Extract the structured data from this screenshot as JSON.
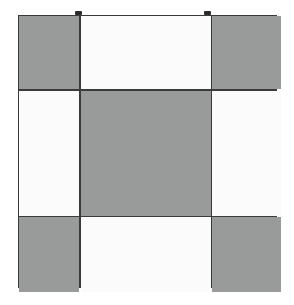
{
  "figure": {
    "canvas": {
      "width": 294,
      "height": 305,
      "background": "#ffffff"
    },
    "palette": {
      "dark_fill": "#999a9a",
      "light_fill": "#fbfbfb",
      "border": "#3a3a3a",
      "nub": "#2b2b2b"
    },
    "grid": {
      "left": 18,
      "top": 15,
      "width": 259,
      "height": 273,
      "rows": 3,
      "columns": 3,
      "column_widths": [
        60,
        130,
        69
      ],
      "row_heights": [
        73,
        125,
        75
      ],
      "border_width": 1.5,
      "gap": 1.5
    },
    "cells": [
      {
        "id": "cell-r1-c1",
        "row": 1,
        "column": 1,
        "fill": "dark",
        "label": ""
      },
      {
        "id": "cell-r1-c2",
        "row": 1,
        "column": 2,
        "fill": "light",
        "label": ""
      },
      {
        "id": "cell-r1-c3",
        "row": 1,
        "column": 3,
        "fill": "dark",
        "label": ""
      },
      {
        "id": "cell-r2-c1",
        "row": 2,
        "column": 1,
        "fill": "light",
        "label": ""
      },
      {
        "id": "cell-r2-c2",
        "row": 2,
        "column": 2,
        "fill": "dark",
        "label": ""
      },
      {
        "id": "cell-r2-c3",
        "row": 2,
        "column": 3,
        "fill": "light",
        "label": ""
      },
      {
        "id": "cell-r3-c1",
        "row": 3,
        "column": 1,
        "fill": "dark",
        "label": ""
      },
      {
        "id": "cell-r3-c2",
        "row": 3,
        "column": 2,
        "fill": "light",
        "label": ""
      },
      {
        "id": "cell-r3-c3",
        "row": 3,
        "column": 3,
        "fill": "dark",
        "label": ""
      }
    ],
    "markers": [
      {
        "id": "top-nub-left",
        "x": 75,
        "y": 11,
        "width": 7,
        "height": 4
      },
      {
        "id": "top-nub-right",
        "x": 204,
        "y": 11,
        "width": 7,
        "height": 4
      }
    ]
  }
}
